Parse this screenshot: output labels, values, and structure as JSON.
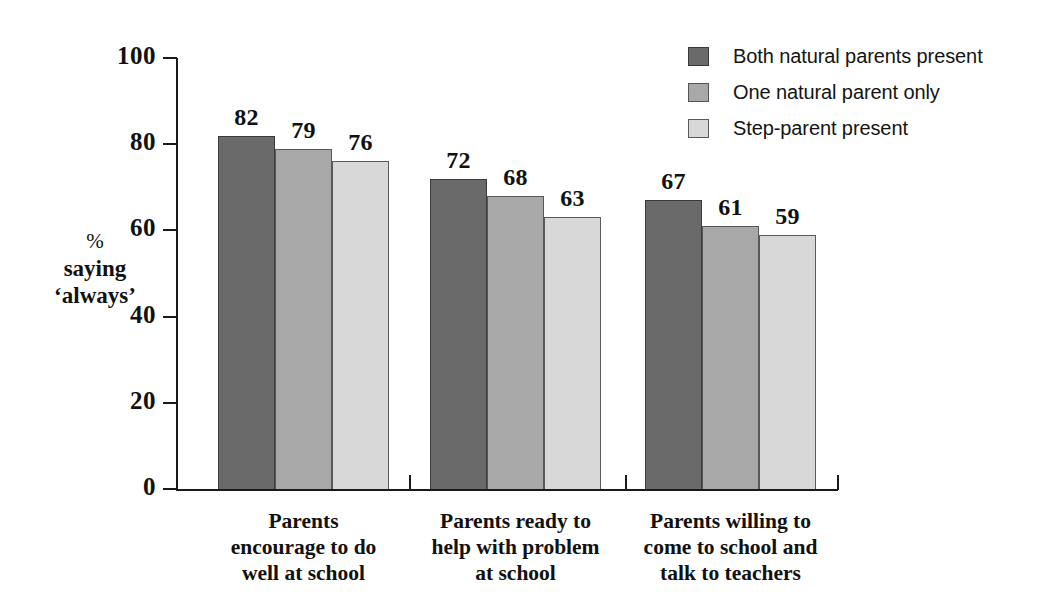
{
  "chart_data": {
    "type": "bar",
    "title": "",
    "subtitle": "",
    "xlabel": "",
    "ylabel": "% saying 'always'",
    "ylim": [
      0,
      100
    ],
    "ytick_labels": [
      "0",
      "20",
      "40",
      "60",
      "80",
      "100"
    ],
    "ytick_values": [
      0,
      20,
      40,
      60,
      80,
      100
    ],
    "grid": false,
    "legend_position": "top-right",
    "categories": [
      "Parents encourage to do well at school",
      "Parents ready to help with problem at school",
      "Parents willing to come to school and talk to teachers"
    ],
    "category_label_lines": [
      [
        "Parents",
        "encourage to do",
        "well at school"
      ],
      [
        "Parents ready to",
        "help with problem",
        "at school"
      ],
      [
        "Parents willing to",
        "come to school and",
        "talk to teachers"
      ]
    ],
    "series": [
      {
        "name": "Both natural parents present",
        "color": "#6a6a6a",
        "values": [
          82,
          72,
          67
        ]
      },
      {
        "name": "One natural parent only",
        "color": "#a8a8a8",
        "values": [
          79,
          68,
          61
        ]
      },
      {
        "name": "Step-parent present",
        "color": "#d8d8d8",
        "values": [
          76,
          63,
          59
        ]
      }
    ],
    "value_labels": [
      [
        "82",
        "79",
        "76"
      ],
      [
        "72",
        "68",
        "63"
      ],
      [
        "67",
        "61",
        "59"
      ]
    ]
  },
  "axis": {
    "y_title_line1": "%",
    "y_title_line2": "saying",
    "y_title_line3": "‘always’"
  },
  "legend": {
    "items": [
      {
        "label": "Both natural parents present",
        "color": "#6a6a6a"
      },
      {
        "label": "One natural parent only",
        "color": "#a8a8a8"
      },
      {
        "label": "Step-parent present",
        "color": "#d8d8d8"
      }
    ]
  }
}
